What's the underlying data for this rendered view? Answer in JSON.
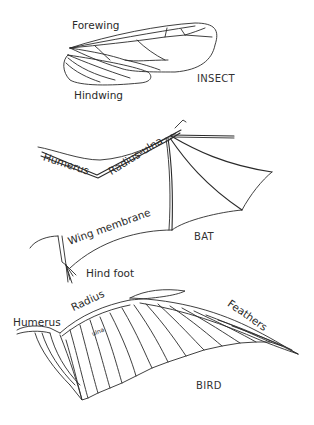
{
  "diagram": {
    "colors": {
      "line": "#2a2a2a",
      "background": "#ffffff"
    },
    "panels": [
      {
        "name": "insect",
        "caption": "INSECT",
        "labels": {
          "forewing": "Forewing",
          "hindwing": "Hindwing"
        }
      },
      {
        "name": "bat",
        "caption": "BAT",
        "labels": {
          "humerus": "Humerus",
          "radius_ulna": "Radius-ulna",
          "wing_membrane": "Wing membrane",
          "hind_foot": "Hind foot"
        }
      },
      {
        "name": "bird",
        "caption": "BIRD",
        "labels": {
          "humerus": "Humerus",
          "radius": "Radius",
          "ulna": "ulna",
          "feathers": "Feathers"
        }
      }
    ]
  }
}
